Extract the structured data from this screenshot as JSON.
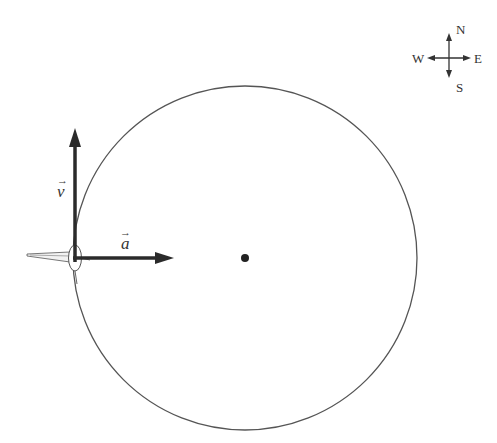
{
  "diagram": {
    "type": "circular-motion",
    "circle": {
      "cx": 245,
      "cy": 258,
      "r": 172,
      "stroke": "#555555"
    },
    "center_point": {
      "cx": 245,
      "cy": 258,
      "r": 4
    },
    "object": {
      "name": "airplane",
      "x": 75,
      "y": 258
    },
    "vectors": {
      "velocity": {
        "label": "v",
        "symbol": "→",
        "direction": "north"
      },
      "acceleration": {
        "label": "a",
        "symbol": "→",
        "direction": "east"
      }
    },
    "compass": {
      "north": "N",
      "south": "S",
      "east": "E",
      "west": "W"
    },
    "colors": {
      "vector": "#2b2b2b",
      "circle": "#555555",
      "text": "#333333"
    }
  }
}
